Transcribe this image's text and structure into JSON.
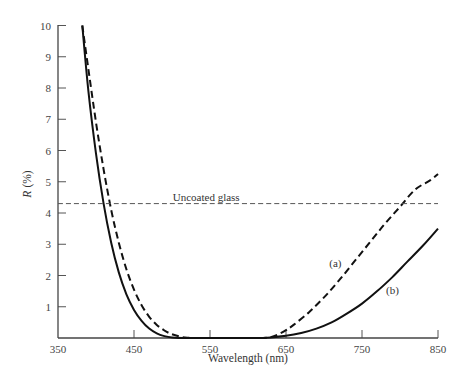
{
  "chart_data": {
    "type": "line",
    "title": "",
    "xlabel": "Wavelength (nm)",
    "ylabel_italic": "R",
    "ylabel_unit": "(%)",
    "ylabel": "R (%)",
    "xlim": [
      350,
      850
    ],
    "ylim": [
      0,
      10
    ],
    "xticks": [
      350,
      450,
      550,
      650,
      750,
      850
    ],
    "yticks": [
      1,
      2,
      3,
      4,
      5,
      6,
      7,
      8,
      9,
      10
    ],
    "grid": false,
    "legend": "none (inline annotations)",
    "series": [
      {
        "name": "(a)",
        "style": "dashed",
        "x": [
          382,
          390,
          400,
          410,
          420,
          430,
          440,
          450,
          460,
          470,
          480,
          490,
          500,
          510,
          520,
          540,
          560,
          580,
          600,
          620,
          630,
          640,
          650,
          660,
          680,
          700,
          720,
          740,
          760,
          780,
          800,
          820,
          840,
          850
        ],
        "y": [
          10.0,
          8.6,
          6.9,
          5.4,
          4.1,
          3.05,
          2.2,
          1.55,
          1.05,
          0.68,
          0.42,
          0.24,
          0.12,
          0.05,
          0.01,
          0.0,
          0.0,
          0.0,
          0.0,
          0.0,
          0.03,
          0.12,
          0.25,
          0.42,
          0.82,
          1.3,
          1.85,
          2.45,
          3.05,
          3.65,
          4.2,
          4.75,
          5.05,
          5.25
        ]
      },
      {
        "name": "(b)",
        "style": "solid",
        "x": [
          382,
          390,
          400,
          410,
          420,
          430,
          440,
          450,
          460,
          470,
          480,
          490,
          500,
          520,
          550,
          580,
          610,
          630,
          650,
          670,
          690,
          710,
          730,
          750,
          770,
          790,
          810,
          830,
          850
        ],
        "y": [
          10.0,
          7.9,
          5.9,
          4.3,
          3.05,
          2.1,
          1.4,
          0.9,
          0.55,
          0.3,
          0.15,
          0.06,
          0.02,
          0.0,
          0.0,
          0.0,
          0.0,
          0.02,
          0.07,
          0.16,
          0.3,
          0.5,
          0.78,
          1.1,
          1.5,
          1.95,
          2.45,
          2.95,
          3.5
        ]
      },
      {
        "name": "Uncoated glass",
        "style": "thin-dashed",
        "x": [
          350,
          850
        ],
        "y": [
          4.3,
          4.3
        ]
      }
    ],
    "annotations": [
      {
        "text": "Uncoated glass",
        "x": 545,
        "y": 4.5
      },
      {
        "text": "(a)",
        "x": 715,
        "y": 2.4
      },
      {
        "text": "(b)",
        "x": 790,
        "y": 1.55
      }
    ]
  }
}
